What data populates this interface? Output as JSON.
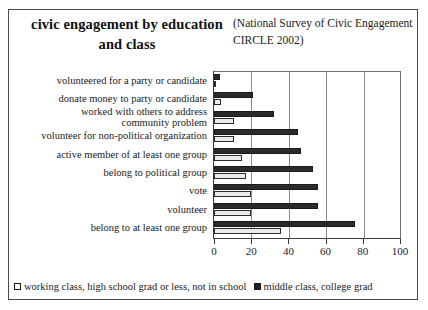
{
  "figure": {
    "title": "civic engagement by education and class",
    "source_note": "(National Survey of Civic Engagement CIRCLE 2002)"
  },
  "chart_data": {
    "type": "bar",
    "orientation": "horizontal",
    "title": "civic engagement by education and class",
    "subtitle": "(National Survey of Civic Engagement CIRCLE 2002)",
    "xlabel": "",
    "ylabel": "",
    "xlim": [
      0,
      100
    ],
    "xticks": [
      0,
      20,
      40,
      60,
      80,
      100
    ],
    "grid": true,
    "grid_axis": "x",
    "legend_position": "bottom",
    "categories": [
      "volunteered for a party or candidate",
      "donate money to party or candidate",
      "worked with others to address community problem",
      "volunteer for non-political organization",
      "active member of at least one group",
      "belong to political group",
      "vote",
      "volunteer",
      "belong to at least one group"
    ],
    "series": [
      {
        "name": "working class, high school grad or less, not in school",
        "color": "#ebebeb",
        "values": [
          1,
          4,
          11,
          11,
          15,
          17,
          20,
          20,
          36
        ]
      },
      {
        "name": "middle class, college grad",
        "color": "#2b2b2b",
        "values": [
          3,
          21,
          32,
          45,
          47,
          53,
          56,
          56,
          76
        ]
      }
    ]
  },
  "axis": {
    "tick_labels": [
      "0",
      "20",
      "40",
      "60",
      "80",
      "100"
    ]
  },
  "legend": {
    "items": [
      {
        "label": "working class, high school grad or less, not in school",
        "swatch": "light"
      },
      {
        "label": "middle class, college grad",
        "swatch": "dark"
      }
    ]
  }
}
